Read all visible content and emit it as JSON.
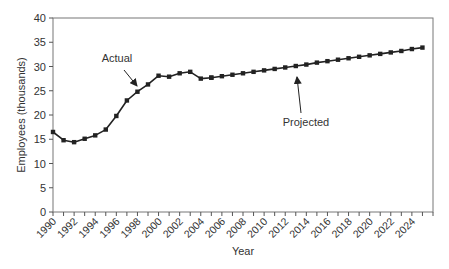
{
  "chart_data": {
    "type": "line",
    "title": "",
    "xlabel": "Year",
    "ylabel": "Employees (thousands)",
    "xlim": [
      1990,
      2026
    ],
    "ylim": [
      0,
      40
    ],
    "yticks": [
      0,
      5,
      10,
      15,
      20,
      25,
      30,
      35,
      40
    ],
    "xtick_labels": [
      "1990",
      "1992",
      "1994",
      "1996",
      "1998",
      "2000",
      "2002",
      "2004",
      "2006",
      "2008",
      "2010",
      "2012",
      "2014",
      "2016",
      "2018",
      "2020",
      "2022",
      "2024"
    ],
    "grid": false,
    "legend": null,
    "series": [
      {
        "name": "Actual",
        "style": "solid line, no markers",
        "x": [
          1990,
          1991,
          1992,
          1993,
          1994,
          1995,
          1996,
          1997,
          1998,
          1999,
          2000,
          2001,
          2002,
          2003,
          2004,
          2005
        ],
        "values": [
          16.5,
          14.8,
          14.4,
          15.1,
          15.8,
          17.0,
          19.8,
          23.0,
          24.8,
          26.3,
          28.1,
          27.9,
          28.6,
          28.9,
          27.5,
          27.7
        ]
      },
      {
        "name": "Projected",
        "style": "line with square markers",
        "x": [
          2005,
          2006,
          2007,
          2008,
          2009,
          2010,
          2011,
          2012,
          2013,
          2014,
          2015,
          2016,
          2017,
          2018,
          2019,
          2020,
          2021,
          2022,
          2023,
          2024,
          2025
        ],
        "values": [
          27.7,
          28.0,
          28.3,
          28.6,
          28.9,
          29.2,
          29.5,
          29.8,
          30.1,
          30.4,
          30.8,
          31.1,
          31.4,
          31.7,
          32.0,
          32.3,
          32.6,
          32.9,
          33.2,
          33.6,
          33.9
        ]
      }
    ],
    "annotations": [
      {
        "text": "Actual",
        "arrow_to_year": 1998,
        "arrow_to_value": 24.8
      },
      {
        "text": "Projected",
        "arrow_to_year": 2013,
        "arrow_to_value": 30.1
      }
    ]
  }
}
